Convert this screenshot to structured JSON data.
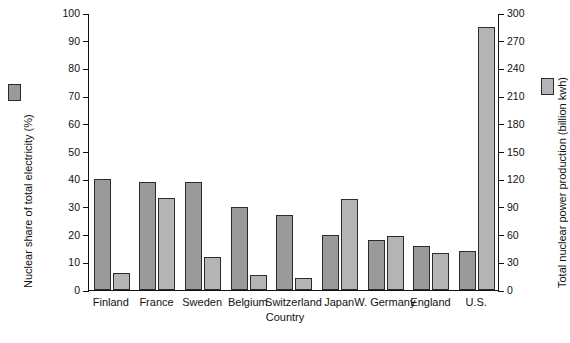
{
  "chart_data": {
    "type": "bar",
    "title": "",
    "xlabel": "Country",
    "categories": [
      "Finland",
      "France",
      "Sweden",
      "Belgium",
      "Switzerland",
      "Japan",
      "W. Germany",
      "England",
      "U.S."
    ],
    "series": [
      {
        "name": "Nuclear share of total electricity (%)",
        "axis": "left",
        "unit": "%",
        "color": "#9a9a9a",
        "values": [
          40,
          39,
          39,
          30,
          27,
          20,
          18,
          16,
          14
        ]
      },
      {
        "name": "Total nuclear power production (billion kwh)",
        "axis": "right",
        "unit": "billion kwh",
        "color": "#b4b4b4",
        "values": [
          18,
          100,
          36,
          16,
          13,
          99,
          59,
          40,
          285
        ]
      }
    ],
    "left_axis": {
      "label": "Nuclear share of total electricity",
      "unit": "(%)",
      "ylim": [
        0,
        100
      ],
      "tick_step": 10,
      "ticks": [
        "0",
        "10",
        "20",
        "30",
        "40",
        "50",
        "60",
        "70",
        "80",
        "90",
        "100"
      ]
    },
    "right_axis": {
      "label": "Total nuclear power production",
      "unit": "(billion kwh)",
      "ylim": [
        0,
        300
      ],
      "tick_step": 30,
      "ticks": [
        "0",
        "30",
        "60",
        "90",
        "120",
        "150",
        "180",
        "210",
        "240",
        "270",
        "300"
      ]
    },
    "grid": false,
    "legend_position": "outside-left-and-right"
  }
}
